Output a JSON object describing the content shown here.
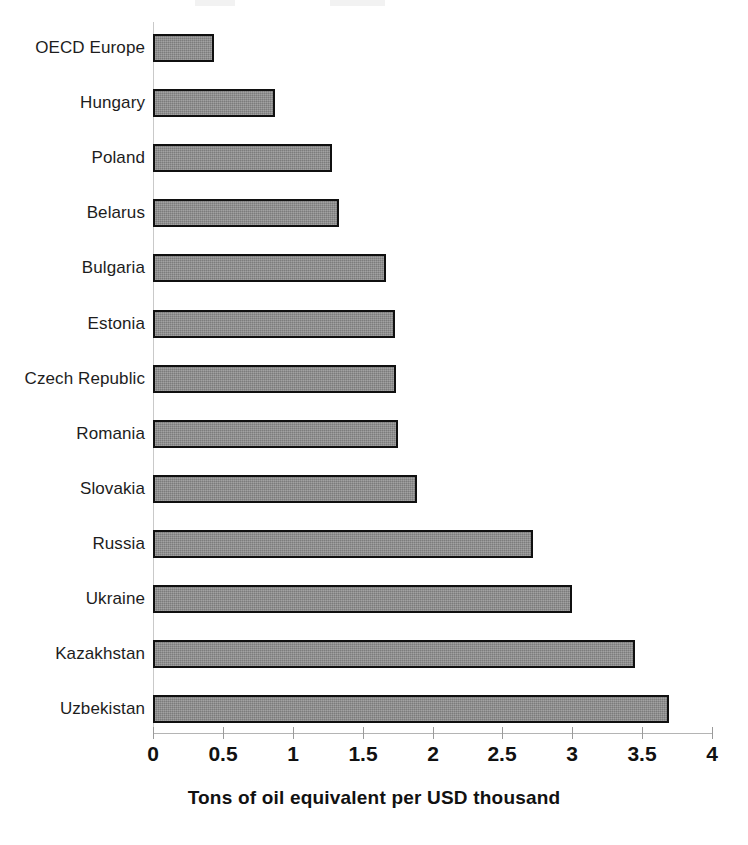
{
  "chart_data": {
    "type": "bar",
    "orientation": "horizontal",
    "title": "",
    "xlabel": "Tons of oil equivalent per USD thousand",
    "ylabel": "",
    "xlim": [
      0,
      4
    ],
    "xticks": [
      "0",
      "0.5",
      "1",
      "1.5",
      "2",
      "2.5",
      "3",
      "3.5",
      "4"
    ],
    "xtick_values": [
      0,
      0.5,
      1,
      1.5,
      2,
      2.5,
      3,
      3.5,
      4
    ],
    "grid": false,
    "legend": "none",
    "categories": [
      "OECD Europe",
      "Hungary",
      "Poland",
      "Belarus",
      "Bulgaria",
      "Estonia",
      "Czech Republic",
      "Romania",
      "Slovakia",
      "Russia",
      "Ukraine",
      "Kazakhstan",
      "Uzbekistan"
    ],
    "values": [
      0.44,
      0.87,
      1.28,
      1.33,
      1.67,
      1.73,
      1.74,
      1.75,
      1.89,
      2.72,
      3.0,
      3.45,
      3.69
    ],
    "bar_color": "#8b8b8b",
    "bar_border_color": "#101010",
    "axis_color": "#b4b4b4",
    "text_color": "#111111"
  }
}
